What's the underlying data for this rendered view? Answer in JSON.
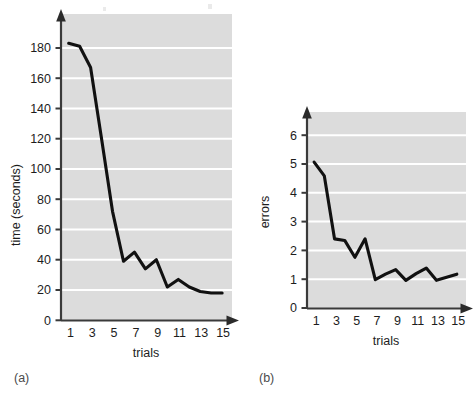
{
  "figure": {
    "background_color": "#ffffff",
    "plot_background_color": "#dcdcdc",
    "gridline_color": "#ffffff",
    "line_color": "#111111",
    "axis_color": "#3a3a3a"
  },
  "panel_a": {
    "letter": "(a)",
    "ylabel": "time (seconds)",
    "xlabel": "trials",
    "ytick_labels": [
      "0",
      "20",
      "40",
      "60",
      "80",
      "100",
      "120",
      "140",
      "160",
      "180"
    ],
    "xtick_labels": [
      "1",
      "3",
      "5",
      "7",
      "9",
      "11",
      "13",
      "15"
    ]
  },
  "panel_b": {
    "letter": "(b)",
    "ylabel": "errors",
    "xlabel": "trials",
    "ytick_labels": [
      "0",
      "1",
      "2",
      "3",
      "4",
      "5",
      "6"
    ],
    "xtick_labels": [
      "1",
      "3",
      "5",
      "7",
      "9",
      "11",
      "13",
      "15"
    ]
  },
  "chart_data": [
    {
      "type": "line",
      "id": "panel-a",
      "title": "",
      "xlabel": "trials",
      "ylabel": "time (seconds)",
      "xlim": [
        0.3,
        15.9
      ],
      "ylim": [
        0,
        190
      ],
      "yticks": [
        0,
        20,
        40,
        60,
        80,
        100,
        120,
        140,
        160,
        180
      ],
      "xticks": [
        1,
        3,
        5,
        7,
        9,
        11,
        13,
        15
      ],
      "grid": "horizontal",
      "legend": "none",
      "x": [
        1,
        2,
        3,
        4,
        5,
        6,
        7,
        8,
        9,
        10,
        11,
        12,
        13,
        14,
        15
      ],
      "values": [
        183,
        181,
        167,
        120,
        72,
        39,
        45,
        34,
        40,
        22,
        27,
        22,
        19,
        18,
        18
      ]
    },
    {
      "type": "line",
      "id": "panel-b",
      "title": "",
      "xlabel": "trials",
      "ylabel": "errors",
      "xlim": [
        0.3,
        15.9
      ],
      "ylim": [
        0,
        6.5
      ],
      "yticks": [
        0,
        1,
        2,
        3,
        4,
        5,
        6
      ],
      "xticks": [
        1,
        3,
        5,
        7,
        9,
        11,
        13,
        15
      ],
      "grid": "horizontal",
      "legend": "none",
      "x": [
        1,
        2,
        3,
        4,
        5,
        6,
        7,
        8,
        9,
        10,
        11,
        12,
        13,
        14,
        15
      ],
      "values": [
        4.75,
        4.3,
        2.25,
        2.2,
        1.65,
        2.25,
        0.92,
        1.1,
        1.25,
        0.9,
        1.12,
        1.3,
        0.9,
        1.0,
        1.1
      ]
    }
  ]
}
